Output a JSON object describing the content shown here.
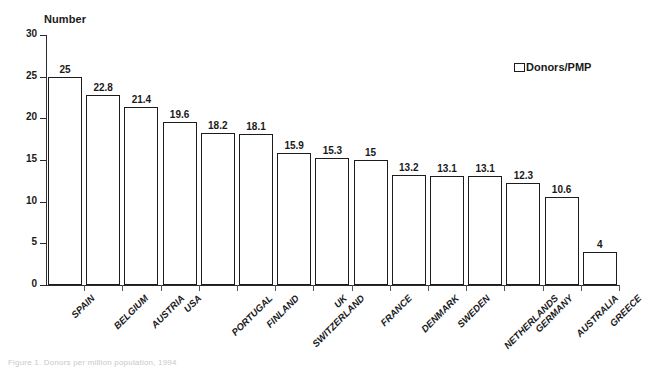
{
  "chart_data": {
    "type": "bar",
    "title": "",
    "ylabel": "Number",
    "xlabel": "",
    "ylim": [
      0,
      30
    ],
    "yticks": [
      0,
      5,
      10,
      15,
      20,
      25,
      30
    ],
    "grid": false,
    "legend_position": "top-right",
    "legend": [
      "Donors/PMP"
    ],
    "categories": [
      "SPAIN",
      "BELGIUM",
      "AUSTRIA",
      "USA",
      "PORTUGAL",
      "FINLAND",
      "SWITZERLAND",
      "UK",
      "FRANCE",
      "DENMARK",
      "SWEDEN",
      "NETHERLANDS",
      "GERMANY",
      "AUSTRALIA",
      "GREECE"
    ],
    "values": [
      25,
      22.8,
      21.4,
      19.6,
      18.2,
      18.1,
      15.9,
      15.3,
      15,
      13.2,
      13.1,
      13.1,
      12.3,
      10.6,
      4
    ],
    "value_labels": [
      "25",
      "22.8",
      "21.4",
      "19.6",
      "18.2",
      "18.1",
      "15.9",
      "15.3",
      "15",
      "13.2",
      "13.1",
      "13.1",
      "12.3",
      "10.6",
      "4"
    ],
    "series": [
      {
        "name": "Donors/PMP",
        "values": [
          25,
          22.8,
          21.4,
          19.6,
          18.2,
          18.1,
          15.9,
          15.3,
          15,
          13.2,
          13.1,
          13.1,
          12.3,
          10.6,
          4
        ]
      }
    ],
    "bar_fill": "#ffffff",
    "bar_edge": "#1c1c1c"
  },
  "legend": {
    "label": "Donors/PMP"
  },
  "axis": {
    "y_title": "Number"
  },
  "caption": {
    "text": "Figure 1. Donors per million population, 1994"
  }
}
